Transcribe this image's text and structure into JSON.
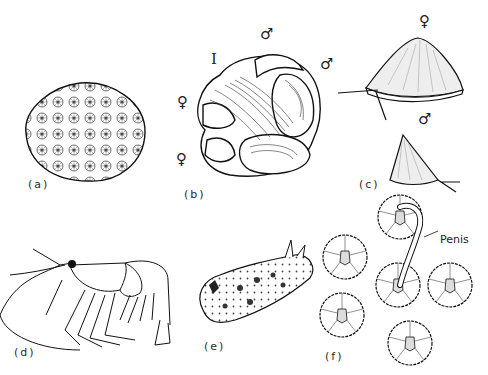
{
  "figure": {
    "panels": [
      {
        "id": "a",
        "label": "(a)",
        "subject": "coral colony"
      },
      {
        "id": "b",
        "label": "(b)",
        "subject": "stack of slipper limpets",
        "annotations": {
          "roman": "I",
          "female_top": "♀",
          "female_bottom": "♀",
          "male_left": "♂",
          "male_right": "♂"
        }
      },
      {
        "id": "c",
        "label": "(c)",
        "subject": "limpets (female above, male below)",
        "annotations": {
          "female": "♀",
          "male": "♂"
        }
      },
      {
        "id": "d",
        "label": "(d)",
        "subject": "shrimp"
      },
      {
        "id": "e",
        "label": "(e)",
        "subject": "sea slug"
      },
      {
        "id": "f",
        "label": "(f)",
        "subject": "barnacle cluster",
        "annotations": {
          "callout": "Penis"
        }
      }
    ]
  },
  "colors": {
    "ink": "#1a1a1a",
    "background": "#ffffff",
    "stipple": "#8a8a8a"
  }
}
